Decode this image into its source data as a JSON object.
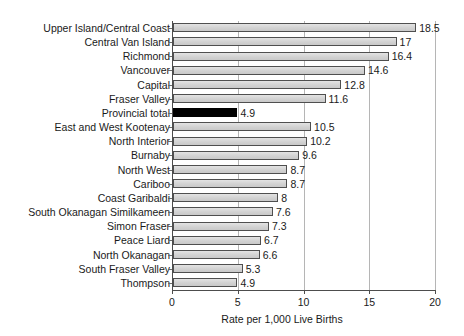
{
  "chart_data": {
    "type": "bar",
    "orientation": "horizontal",
    "title": "",
    "xlabel": "Rate per 1,000 Live Births",
    "ylabel": "",
    "xlim": [
      0,
      20
    ],
    "xticks": [
      0,
      5,
      10,
      15,
      20
    ],
    "xtick_labels": [
      "0",
      "5",
      "10",
      "15",
      "20"
    ],
    "grid": true,
    "grid_axis": "x",
    "legend": false,
    "categories": [
      "Upper Island/Central Coast",
      "Central Van Island",
      "Richmond",
      "Vancouver",
      "Capital",
      "Fraser Valley",
      "Provincial total",
      "East and West Kootenay",
      "North Interior",
      "Burnaby",
      "North West",
      "Cariboo",
      "Coast Garibaldi",
      "South Okanagan Similkameen",
      "Simon Fraser",
      "Peace Liard",
      "North Okanagan",
      "South Fraser Valley",
      "Thompson"
    ],
    "values": [
      18.5,
      17,
      16.4,
      14.6,
      12.8,
      11.6,
      4.9,
      10.5,
      10.2,
      9.6,
      8.7,
      8.7,
      8,
      7.6,
      7.3,
      6.7,
      6.6,
      5.3,
      4.9
    ],
    "value_labels": [
      "18.5",
      "17",
      "16.4",
      "14.6",
      "12.8",
      "11.6",
      "4.9",
      "10.5",
      "10.2",
      "9.6",
      "8.7",
      "8.7",
      "8",
      "7.6",
      "7.3",
      "6.7",
      "6.6",
      "5.3",
      "4.9"
    ],
    "highlight_category": "Provincial total",
    "colors": {
      "bar_fill": "#d4d4d4",
      "bar_border": "#4f4f4f",
      "highlight_fill": "#000000",
      "gridline": "#b5b5b5",
      "axis": "#4d4d4d",
      "text": "#1a1a1a",
      "background": "#ffffff"
    }
  }
}
